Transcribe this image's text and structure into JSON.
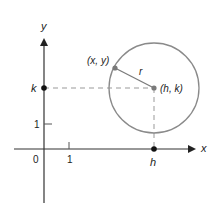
{
  "diagram": {
    "axes": {
      "x_label": "x",
      "y_label": "y",
      "origin_label": "0",
      "x_tick_label": "1",
      "y_tick_label": "1"
    },
    "center": {
      "label": "(h, k)",
      "h_label": "h",
      "k_label": "k"
    },
    "point_on_circle": {
      "label": "(x, y)"
    },
    "radius_label": "r",
    "colors": {
      "axis": "#333333",
      "circle": "#8a8a8a",
      "point": "#7a7a7a",
      "dashed": "#999999"
    }
  }
}
